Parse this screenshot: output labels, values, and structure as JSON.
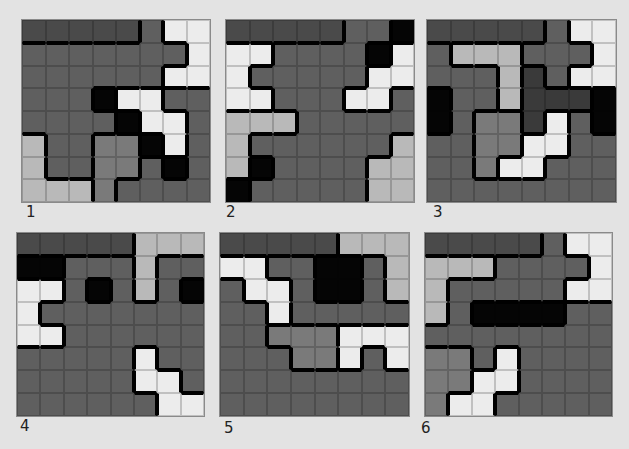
{
  "palette": {
    "D": "#4a4a4a",
    "G": "#5f5f5f",
    "M": "#7a7a7a",
    "L": "#b9b9b9",
    "W": "#ececec",
    "K": "#050505",
    "X": "#3a3a3a"
  },
  "puzzles": [
    {
      "label": "1",
      "x": 22,
      "y": 20,
      "w": 188,
      "h": 182,
      "lx": 26,
      "ly": 203,
      "rows": [
        "DDDDDGWW",
        "GGGGGGGW",
        "GGGGGGWW",
        "GGGKWWGG",
        "GGGGKWWG",
        "LGGMMKWG",
        "LGGMMGKG",
        "LLLMGGGG"
      ]
    },
    {
      "label": "2",
      "x": 226,
      "y": 20,
      "w": 188,
      "h": 182,
      "lx": 226,
      "ly": 203,
      "rows": [
        "DDDDDGGK",
        "WWGGGGKW",
        "WGGGGGWW",
        "WWGGGWWG",
        "LLLGGGGG",
        "LGGGGGGL",
        "LKGGGGLL",
        "KGGGGGLL"
      ]
    },
    {
      "label": "3",
      "x": 427,
      "y": 20,
      "w": 189,
      "h": 182,
      "lx": 433,
      "ly": 203,
      "rows": [
        "DDDDDGWW",
        "GLLLGGGW",
        "GGGLXGWW",
        "KGGLXXXK",
        "KGMMXWGK",
        "GGMMWWGG",
        "GGMWWGGG",
        "GGGGGGGG"
      ]
    },
    {
      "label": "4",
      "x": 17,
      "y": 233,
      "w": 187,
      "h": 183,
      "lx": 20,
      "ly": 417,
      "rows": [
        "DDDDDLLL",
        "KKGGGLGG",
        "WWGKGLGK",
        "WGGGGGGG",
        "WWGGGGGG",
        "GGGGGWGG",
        "GGGGGWWG",
        "GGGGGGWW"
      ]
    },
    {
      "label": "5",
      "x": 220,
      "y": 233,
      "w": 189,
      "h": 183,
      "lx": 224,
      "ly": 419,
      "rows": [
        "DDDDDLLL",
        "WWGGKKGL",
        "GWWGKKGL",
        "GGWGGGGG",
        "GGMMMWWW",
        "GGGMMWGW",
        "GGGGGGGG",
        "GGGGGGGG"
      ]
    },
    {
      "label": "6",
      "x": 425,
      "y": 233,
      "w": 187,
      "h": 183,
      "lx": 421,
      "ly": 419,
      "rows": [
        "DDDDDGWW",
        "LLLGGGGW",
        "LGGGGGWW",
        "LGKKKKGG",
        "GGGGGGGG",
        "MMGWGGGG",
        "MMWWGGGG",
        "MWWGGGGG"
      ]
    }
  ]
}
